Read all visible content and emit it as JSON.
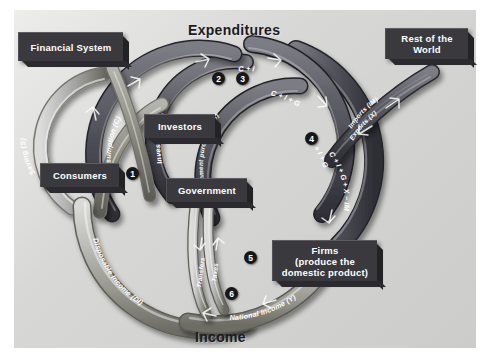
{
  "figure": {
    "type": "circular-flow-diagram",
    "top_title": "Expenditures",
    "bottom_title": "Income"
  },
  "boxes": [
    {
      "id": "financial-system",
      "label": "Financial System"
    },
    {
      "id": "consumers",
      "label": "Consumers"
    },
    {
      "id": "investors",
      "label": "Investors"
    },
    {
      "id": "government",
      "label": "Government"
    },
    {
      "id": "firms",
      "label": "Firms\n(produce the\ndomestic product)",
      "line1": "Firms",
      "line2": "(produce the",
      "line3": "domestic product)"
    },
    {
      "id": "rest-of-the-world",
      "label": "Rest of the\nWorld",
      "line1": "Rest of the",
      "line2": "World"
    }
  ],
  "flow_labels": {
    "saving": "Saving (S)",
    "consumption": "Consumption (C)",
    "investment": "Investment (I)",
    "government_purchases": "Government purchases (G)",
    "imports": "Imports (IM)",
    "exports": "Exports (X)",
    "taxes": "Taxes",
    "transfers": "Transfers",
    "disposable_income": "Disposable Income (DI)",
    "national_income": "National Income (Y)"
  },
  "formulas": {
    "f1": "C + I",
    "f2": "C + I + G",
    "f3": "C + I + G",
    "f4": "C + I + G + X − IM",
    "f5": "+ X − IM"
  },
  "markers": [
    {
      "n": "1"
    },
    {
      "n": "2"
    },
    {
      "n": "3"
    },
    {
      "n": "4"
    },
    {
      "n": "5"
    },
    {
      "n": "6"
    }
  ],
  "colors": {
    "panel": "#d7d7d5",
    "box": "#3a3a3e",
    "pipe_dark": "#5a5a60",
    "pipe_light": "#b9b9b5",
    "text": "#ffffff",
    "title": "#1b1b1e"
  }
}
